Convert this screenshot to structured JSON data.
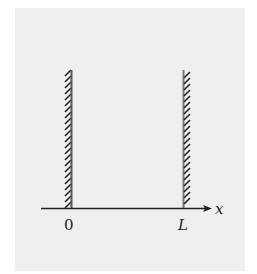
{
  "diagram": {
    "axis": {
      "label": "x",
      "tick_labels": [
        "0",
        "L"
      ]
    },
    "walls": [
      {
        "position_label": "0",
        "hatch_side": "left"
      },
      {
        "position_label": "L",
        "hatch_side": "right"
      }
    ],
    "colors": {
      "background_panel": "#efefef",
      "page": "#ffffff",
      "ink": "#222222",
      "wall_line": "#555555"
    }
  }
}
